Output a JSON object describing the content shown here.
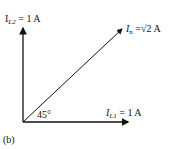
{
  "diagram": {
    "caption": "(b)",
    "angle_label": "45°",
    "vectors": [
      {
        "name": "IL2",
        "symbol": "I",
        "sub": "L2",
        "value": "= 1 A",
        "direction": "vertical"
      },
      {
        "name": "In",
        "symbol": "I",
        "sub": "n",
        "value": "=√2 A",
        "direction": "45-degree"
      },
      {
        "name": "IL1",
        "symbol": "I",
        "sub": "L1",
        "value": "= 1 A",
        "direction": "horizontal"
      }
    ]
  }
}
